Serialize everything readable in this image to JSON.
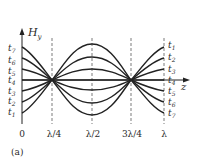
{
  "figure": {
    "panel_label": "(a)",
    "y_axis_label": "H",
    "y_axis_subscript": "y",
    "x_axis_label": "z",
    "x_ticks": [
      "0",
      "λ/4",
      "λ/2",
      "3λ/4",
      "λ"
    ],
    "left_labels": [
      {
        "base": "t",
        "sub": "7"
      },
      {
        "base": "t",
        "sub": "6"
      },
      {
        "base": "t",
        "sub": "5"
      },
      {
        "base": "t",
        "sub": "4"
      },
      {
        "base": "t",
        "sub": "3"
      },
      {
        "base": "t",
        "sub": "2"
      },
      {
        "base": "t",
        "sub": "1"
      }
    ],
    "right_labels": [
      {
        "base": "t",
        "sub": "1"
      },
      {
        "base": "t",
        "sub": "2"
      },
      {
        "base": "t",
        "sub": "3"
      },
      {
        "base": "t",
        "sub": "4"
      },
      {
        "base": "t",
        "sub": "5"
      },
      {
        "base": "t",
        "sub": "6"
      },
      {
        "base": "t",
        "sub": "7"
      }
    ],
    "curve_color": "#222222"
  }
}
